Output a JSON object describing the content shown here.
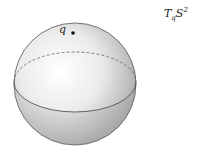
{
  "figure": {
    "sphere": {
      "cx": 75,
      "cy": 84,
      "r": 61
    },
    "equator": {
      "ry": 30,
      "front": "solid",
      "back": "dashed"
    },
    "colors": {
      "sphere_light": "#ffffff",
      "sphere_dark": "#9a9a9a",
      "outline": "#555555"
    }
  },
  "labels": {
    "point": "q",
    "tangent_space": {
      "base": "T",
      "sub": "q",
      "main": "S",
      "sup": "2"
    }
  }
}
